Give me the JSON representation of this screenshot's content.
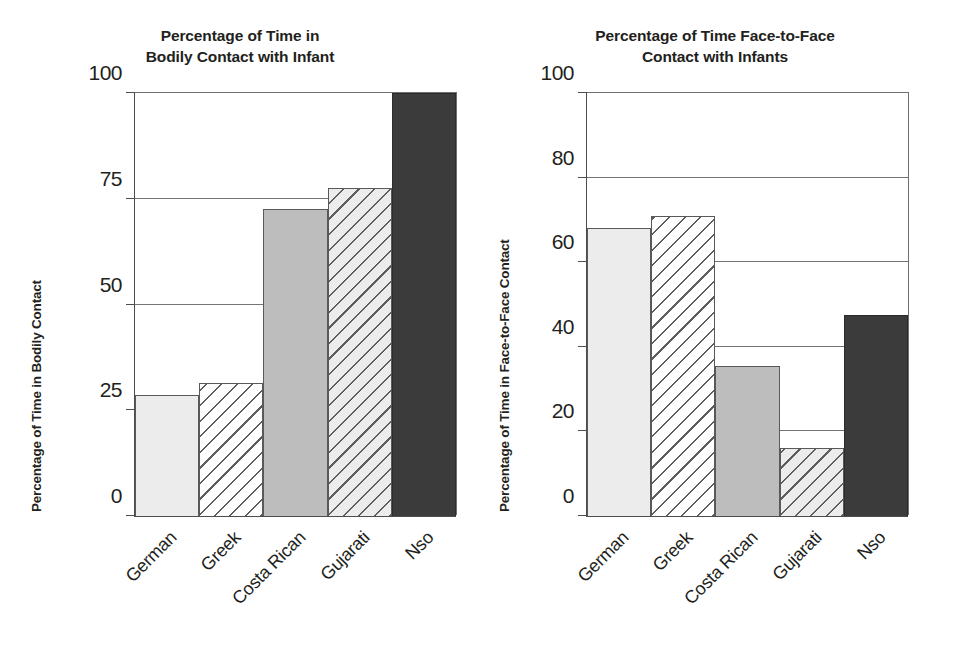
{
  "figure": {
    "background": "#ffffff",
    "ink_color": "#231f20",
    "bar_outline_color": "#595959",
    "gridline_color": "#757575"
  },
  "chart_data": [
    {
      "type": "bar",
      "panel": "left",
      "title": "Percentage of Time in Bodily Contact with Infant",
      "title_lines": [
        "Percentage of Time in",
        "Bodily Contact with Infant"
      ],
      "xlabel": "",
      "ylabel": "Percentage of Time in Bodily Contact",
      "categories": [
        "German",
        "Greek",
        "Costa Rican",
        "Gujarati",
        "Nso"
      ],
      "values": [
        28.5,
        31.5,
        72.5,
        77.5,
        100
      ],
      "ylim": [
        0,
        100
      ],
      "yticks": [
        0,
        25,
        50,
        75,
        100
      ],
      "ytick_labels": [
        "0",
        "25",
        "50",
        "75",
        "100"
      ],
      "grid": true,
      "legend": "none",
      "bar_styles": [
        "fill-light",
        "fill-hatch-white",
        "fill-mid",
        "fill-hatch-light",
        "fill-dark"
      ]
    },
    {
      "type": "bar",
      "panel": "right",
      "title": "Percentage of Time Face-to-Face Contact with Infants",
      "title_lines": [
        "Percentage of Time Face-to-Face",
        "Contact with Infants"
      ],
      "xlabel": "",
      "ylabel": "Percentage of Time in Face-to-Face Contact",
      "categories": [
        "German",
        "Greek",
        "Costa Rican",
        "Gujarati",
        "Nso"
      ],
      "values": [
        68,
        71,
        35.5,
        16,
        47.5
      ],
      "ylim": [
        0,
        100
      ],
      "yticks": [
        0,
        20,
        40,
        60,
        80,
        100
      ],
      "ytick_labels": [
        "0",
        "20",
        "40",
        "60",
        "80",
        "100"
      ],
      "grid": true,
      "legend": "none",
      "bar_styles": [
        "fill-light",
        "fill-hatch-white",
        "fill-mid",
        "fill-hatch-light",
        "fill-dark"
      ]
    }
  ]
}
